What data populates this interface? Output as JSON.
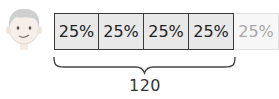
{
  "diagram": {
    "type": "tape-diagram",
    "segments": [
      {
        "label": "25%",
        "state": "filled"
      },
      {
        "label": "25%",
        "state": "filled"
      },
      {
        "label": "25%",
        "state": "filled"
      },
      {
        "label": "25%",
        "state": "filled"
      },
      {
        "label": "25%",
        "state": "faded"
      }
    ],
    "brace_total": "120",
    "brace_spans_segments": 4
  },
  "character": {
    "icon": "boy-face-icon"
  }
}
